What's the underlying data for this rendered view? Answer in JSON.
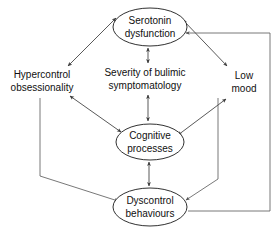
{
  "diagram": {
    "type": "cyclic-influence-diagram",
    "colors": {
      "background": "#ffffff",
      "node_stroke": "#1a1a1a",
      "node_fill": "#ffffff",
      "edge": "#3b3b3b",
      "text": "#101010"
    },
    "nodes": [
      {
        "id": "serotonin",
        "shape": "ellipse",
        "lines": [
          "Serotonin",
          "dysfunction"
        ],
        "cx": 150,
        "cy": 27,
        "rx": 37,
        "ry": 19
      },
      {
        "id": "cognitive",
        "shape": "ellipse",
        "lines": [
          "Cognitive",
          "processes"
        ],
        "cx": 150,
        "cy": 142,
        "rx": 34,
        "ry": 18
      },
      {
        "id": "dyscontrol",
        "shape": "ellipse",
        "lines": [
          "Dyscontrol",
          "behaviours"
        ],
        "cx": 150,
        "cy": 207,
        "rx": 37,
        "ry": 19
      },
      {
        "id": "hypercontrol",
        "shape": "text",
        "lines": [
          "Hypercontrol",
          "obsessionality"
        ],
        "cx": 42,
        "cy": 81,
        "rx": 0,
        "ry": 0
      },
      {
        "id": "severity",
        "shape": "text",
        "lines": [
          "Severity of bulimic",
          "symptomatology"
        ],
        "cx": 145,
        "cy": 79,
        "rx": 0,
        "ry": 0
      },
      {
        "id": "lowmood",
        "shape": "text",
        "lines": [
          "Low",
          "mood"
        ],
        "cx": 243,
        "cy": 82,
        "rx": 0,
        "ry": 0
      }
    ],
    "edges": [
      {
        "from": "hypercontrol",
        "to": "serotonin",
        "style": "double-arrow-diagonal"
      },
      {
        "from": "hypercontrol",
        "to": "cognitive",
        "style": "double-arrow-diagonal"
      },
      {
        "from": "lowmood",
        "to": "serotonin",
        "style": "double-arrow-diagonal"
      },
      {
        "from": "lowmood",
        "to": "cognitive",
        "style": "double-arrow-diagonal"
      },
      {
        "from": "serotonin",
        "to": "severity",
        "style": "double-arrow-vertical"
      },
      {
        "from": "severity",
        "to": "cognitive",
        "style": "double-arrow-vertical"
      },
      {
        "from": "cognitive",
        "to": "dyscontrol",
        "style": "double-arrow-vertical"
      },
      {
        "from": "hypercontrol",
        "to": "dyscontrol",
        "style": "elbow-single-arrow-left"
      },
      {
        "from": "lowmood",
        "to": "dyscontrol",
        "style": "elbow-single-arrow-right"
      },
      {
        "from": "dyscontrol",
        "to": "serotonin",
        "style": "feedback-loop-far-right"
      }
    ]
  }
}
